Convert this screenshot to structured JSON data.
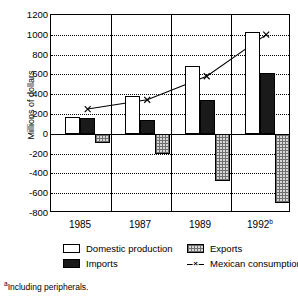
{
  "chart_data": {
    "type": "bar",
    "title": "",
    "xlabel": "",
    "ylabel": "Millions of dollars",
    "categories": [
      "1985",
      "1987",
      "1989",
      "1992"
    ],
    "category_superscripts": [
      "",
      "",
      "",
      "b"
    ],
    "ylim": [
      -800,
      1200
    ],
    "ytick_step": 200,
    "yticks": [
      "1200",
      "1000",
      "800",
      "600",
      "400",
      "200",
      "0",
      "-200",
      "-400",
      "-600",
      "-800"
    ],
    "ytick_values": [
      1200,
      1000,
      800,
      600,
      400,
      200,
      0,
      -200,
      -400,
      -600,
      -800
    ],
    "grid": true,
    "grid_style": "dotted-horizontal",
    "legend_position": "below-axes",
    "series": [
      {
        "name": "Domestic production",
        "type": "bar",
        "fill": "white",
        "values": [
          170,
          385,
          680,
          1030
        ]
      },
      {
        "name": "Imports",
        "type": "bar",
        "fill": "black",
        "values": [
          155,
          135,
          345,
          615
        ]
      },
      {
        "name": "Exports",
        "type": "bar",
        "fill": "hatched-gray",
        "values": [
          -90,
          -205,
          -480,
          -700
        ]
      },
      {
        "name": "Mexican consumption",
        "name_superscript": "c",
        "type": "line",
        "marker": "x",
        "values": [
          240,
          335,
          575,
          1000
        ]
      }
    ]
  },
  "axis": {
    "ylabel": "Millions of dollars"
  },
  "legend": {
    "items": [
      {
        "label": "Domestic production",
        "swatch": "white-square"
      },
      {
        "label": "Exports",
        "swatch": "hatched-square"
      },
      {
        "label": "Imports",
        "swatch": "black-square"
      },
      {
        "label": "Mexican consumption",
        "swatch": "line-x-marker",
        "superscript": "c"
      }
    ]
  },
  "footnotes": {
    "a": "Including peripherals.",
    "a_marker": "a"
  }
}
